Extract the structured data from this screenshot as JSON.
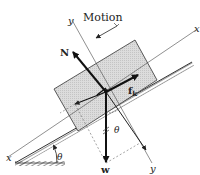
{
  "diagram": {
    "labels": {
      "motion": "Motion",
      "normal_force": "N",
      "weight": "w",
      "friction": "f",
      "friction_sub": "k",
      "angle_incline": "θ",
      "angle_weight": "θ",
      "x_axis_left": "x",
      "x_axis_right": "x",
      "y_axis_top": "y",
      "y_axis_bottom": "y"
    },
    "colors": {
      "block_fill": "#d6d6d6",
      "line": "#222222",
      "hatch": "#555555"
    }
  }
}
